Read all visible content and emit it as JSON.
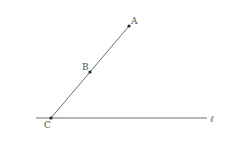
{
  "diagram": {
    "colors": {
      "line": "#6e6e6e",
      "point": "#222222",
      "label": "#555555",
      "background": "#ffffff"
    },
    "points": [
      {
        "id": "A",
        "label": "A",
        "x": 129,
        "y": 26,
        "label_x": 131,
        "label_y": 24
      },
      {
        "id": "B",
        "label": "B",
        "x": 90,
        "y": 72,
        "label_x": 82,
        "label_y": 70
      },
      {
        "id": "C",
        "label": "C",
        "x": 51,
        "y": 118,
        "label_x": 44,
        "label_y": 128
      }
    ],
    "segments": [
      {
        "id": "CA",
        "from": "C",
        "to": "A"
      }
    ],
    "lines": [
      {
        "id": "l",
        "label": "ℓ",
        "x1": 36,
        "y1": 118,
        "x2": 207,
        "y2": 118,
        "label_x": 210,
        "label_y": 122
      }
    ]
  }
}
